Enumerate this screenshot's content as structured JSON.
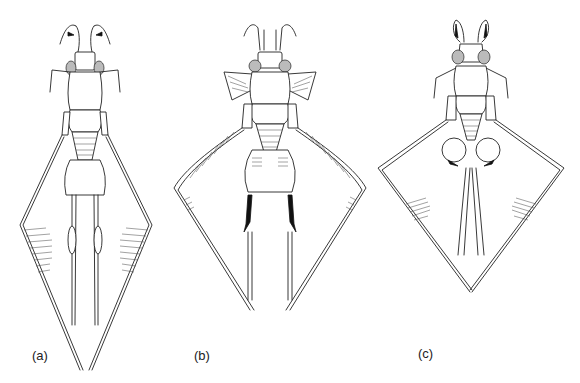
{
  "figure": {
    "panels": [
      {
        "id": "a",
        "label": "(a)"
      },
      {
        "id": "b",
        "label": "(b)"
      },
      {
        "id": "c",
        "label": "(c)"
      }
    ]
  }
}
